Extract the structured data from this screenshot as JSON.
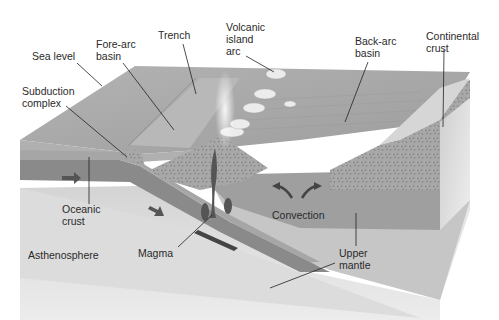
{
  "diagram": {
    "colors": {
      "sea_surface": "#a9a9a9",
      "ocean_floor": "#9c9c9c",
      "oceanic_crust": "#8c8c8c",
      "upper_mantle": "#b5b5b5",
      "asthenosphere": "#d8d8d8",
      "magma": "#555555",
      "continental_crust": "#bdbdbd",
      "label_text": "#2a2a2a"
    },
    "labels": {
      "sea_level": "Sea level",
      "fore_arc_basin": "Fore-arc\nbasin",
      "trench": "Trench",
      "volcanic_island_arc": "Volcanic\nisland\narc",
      "back_arc_basin": "Back-arc\nbasin",
      "continental_crust": "Continental\ncrust",
      "subduction_complex": "Subduction\ncomplex",
      "oceanic_crust": "Oceanic\ncrust",
      "convection": "Convection",
      "asthenosphere": "Asthenosphere",
      "magma": "Magma",
      "upper_mantle": "Upper\nmantle"
    }
  }
}
